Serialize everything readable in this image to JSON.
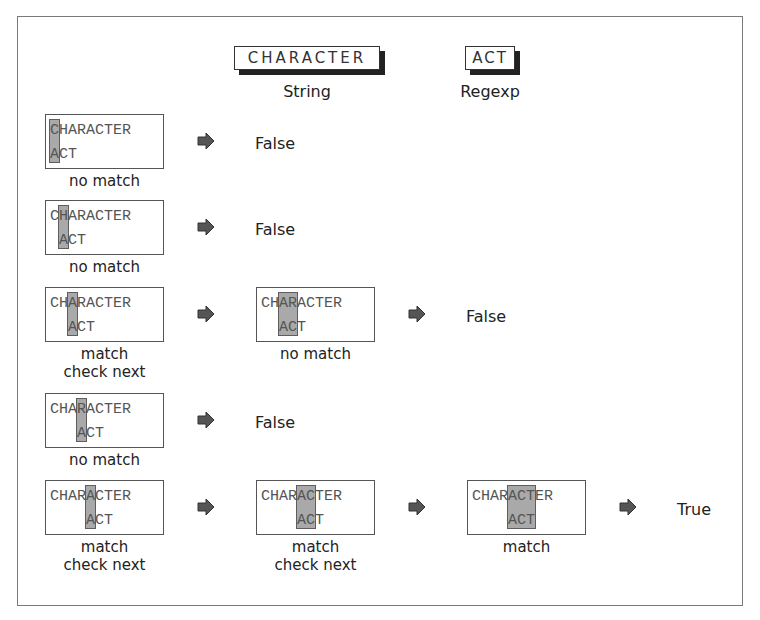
{
  "header": {
    "string_box": "CHARACTER",
    "string_label": "String",
    "regexp_box": "ACT",
    "regexp_label": "Regexp"
  },
  "colors": {
    "highlight": "#a9a9a9",
    "arrow": "#555555",
    "frame": "#7a7a7a"
  },
  "rows": [
    {
      "steps": [
        {
          "top": "CHARACTER",
          "bottom": "ACT",
          "bottom_offset": 0,
          "hl_start": 0,
          "hl_len": 1,
          "caption": "no match"
        }
      ],
      "result": "False"
    },
    {
      "steps": [
        {
          "top": "CHARACTER",
          "bottom": "ACT",
          "bottom_offset": 1,
          "hl_start": 1,
          "hl_len": 1,
          "caption": "no match"
        }
      ],
      "result": "False"
    },
    {
      "steps": [
        {
          "top": "CHARACTER",
          "bottom": "ACT",
          "bottom_offset": 2,
          "hl_start": 2,
          "hl_len": 1,
          "caption": "match\ncheck next"
        },
        {
          "top": "CHARACTER",
          "bottom": "ACT",
          "bottom_offset": 2,
          "hl_start": 2,
          "hl_len": 2,
          "caption": "no match"
        }
      ],
      "result": "False"
    },
    {
      "steps": [
        {
          "top": "CHARACTER",
          "bottom": "ACT",
          "bottom_offset": 3,
          "hl_start": 3,
          "hl_len": 1,
          "caption": "no match"
        }
      ],
      "result": "False"
    },
    {
      "steps": [
        {
          "top": "CHARACTER",
          "bottom": "ACT",
          "bottom_offset": 4,
          "hl_start": 4,
          "hl_len": 1,
          "caption": "match\ncheck next"
        },
        {
          "top": "CHARACTER",
          "bottom": "ACT",
          "bottom_offset": 4,
          "hl_start": 4,
          "hl_len": 2,
          "caption": "match\ncheck next"
        },
        {
          "top": "CHARACTER",
          "bottom": "ACT",
          "bottom_offset": 4,
          "hl_start": 4,
          "hl_len": 3,
          "caption": "match"
        }
      ],
      "result": "True"
    }
  ]
}
